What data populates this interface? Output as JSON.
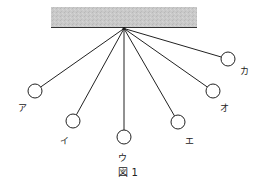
{
  "figure": {
    "caption": "図 1",
    "ceiling_color": "#c8c8c8",
    "pendulums": [
      {
        "id": "a",
        "label": "ア"
      },
      {
        "id": "i",
        "label": "イ"
      },
      {
        "id": "u",
        "label": "ウ"
      },
      {
        "id": "e",
        "label": "エ"
      },
      {
        "id": "o",
        "label": "オ"
      },
      {
        "id": "ka",
        "label": "カ"
      }
    ]
  }
}
